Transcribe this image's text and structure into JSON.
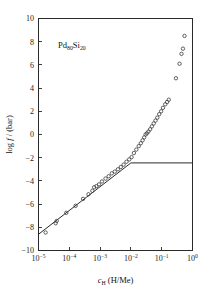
{
  "chart_data": {
    "type": "scatter",
    "title": "",
    "sample_label": {
      "element1": "Pd",
      "subscript1": "80",
      "element2": "Si",
      "subscript2": "20",
      "full": "Pd80Si20"
    },
    "xlabel": {
      "symbol": "c",
      "symbol_sub": "H",
      "units": "(H/Me)",
      "full": "cH (H/Me)"
    },
    "ylabel": {
      "prefix": "log",
      "symbol": "f",
      "suffix": "/ (bar)",
      "full": "log f / (bar)"
    },
    "xscale": "log",
    "xlim": [
      1e-05,
      1
    ],
    "ylim": [
      -10,
      10
    ],
    "grid": false,
    "legend": null,
    "xticks": [
      {
        "value": 1e-05,
        "mantissa": "10",
        "exponent": "−5"
      },
      {
        "value": 0.0001,
        "mantissa": "10",
        "exponent": "−4"
      },
      {
        "value": 0.001,
        "mantissa": "10",
        "exponent": "−3"
      },
      {
        "value": 0.01,
        "mantissa": "10",
        "exponent": "−2"
      },
      {
        "value": 0.1,
        "mantissa": "10",
        "exponent": "−1"
      },
      {
        "value": 1.0,
        "mantissa": "10",
        "exponent": "0"
      }
    ],
    "yticks": [
      {
        "value": 10,
        "label": "10"
      },
      {
        "value": 8,
        "label": "8"
      },
      {
        "value": 6,
        "label": "6"
      },
      {
        "value": 4,
        "label": "4"
      },
      {
        "value": 2,
        "label": "2"
      },
      {
        "value": 0,
        "label": "0"
      },
      {
        "value": -2,
        "label": "−2"
      },
      {
        "value": -4,
        "label": "−4"
      },
      {
        "value": -6,
        "label": "−6"
      },
      {
        "value": -8,
        "label": "−8"
      },
      {
        "value": -10,
        "label": "−10"
      }
    ],
    "series": [
      {
        "name": "measured isotherm",
        "marker": "open-circle",
        "points": [
          {
            "x": 1.7e-05,
            "y": -8.45
          },
          {
            "x": 3.6e-05,
            "y": -7.65
          },
          {
            "x": 3.9e-05,
            "y": -7.45
          },
          {
            "x": 8e-05,
            "y": -6.75
          },
          {
            "x": 0.00016,
            "y": -6.15
          },
          {
            "x": 0.00028,
            "y": -5.55
          },
          {
            "x": 0.00042,
            "y": -5.15
          },
          {
            "x": 0.00056,
            "y": -4.85
          },
          {
            "x": 0.00064,
            "y": -4.55
          },
          {
            "x": 0.00076,
            "y": -4.45
          },
          {
            "x": 0.00092,
            "y": -4.3
          },
          {
            "x": 0.00115,
            "y": -4.05
          },
          {
            "x": 0.0015,
            "y": -3.8
          },
          {
            "x": 0.0019,
            "y": -3.6
          },
          {
            "x": 0.0024,
            "y": -3.35
          },
          {
            "x": 0.003,
            "y": -3.2
          },
          {
            "x": 0.0038,
            "y": -3.0
          },
          {
            "x": 0.0047,
            "y": -2.8
          },
          {
            "x": 0.0058,
            "y": -2.6
          },
          {
            "x": 0.0072,
            "y": -2.35
          },
          {
            "x": 0.0088,
            "y": -2.15
          },
          {
            "x": 0.0105,
            "y": -1.95
          },
          {
            "x": 0.0125,
            "y": -1.6
          },
          {
            "x": 0.015,
            "y": -1.3
          },
          {
            "x": 0.018,
            "y": -1.0
          },
          {
            "x": 0.021,
            "y": -0.75
          },
          {
            "x": 0.024,
            "y": -0.5
          },
          {
            "x": 0.027,
            "y": -0.25
          },
          {
            "x": 0.03,
            "y": 0.0
          },
          {
            "x": 0.033,
            "y": 0.1
          },
          {
            "x": 0.037,
            "y": 0.25
          },
          {
            "x": 0.042,
            "y": 0.45
          },
          {
            "x": 0.048,
            "y": 0.7
          },
          {
            "x": 0.055,
            "y": 0.95
          },
          {
            "x": 0.063,
            "y": 1.2
          },
          {
            "x": 0.072,
            "y": 1.45
          },
          {
            "x": 0.083,
            "y": 1.75
          },
          {
            "x": 0.096,
            "y": 2.0
          },
          {
            "x": 0.11,
            "y": 2.3
          },
          {
            "x": 0.13,
            "y": 2.6
          },
          {
            "x": 0.15,
            "y": 2.8
          },
          {
            "x": 0.17,
            "y": 3.0
          },
          {
            "x": 0.29,
            "y": 4.85
          },
          {
            "x": 0.38,
            "y": 6.1
          },
          {
            "x": 0.44,
            "y": 6.95
          },
          {
            "x": 0.49,
            "y": 7.4
          },
          {
            "x": 0.55,
            "y": 8.5
          }
        ]
      }
    ],
    "annotations": [
      {
        "name": "sieverts-law-line",
        "type": "line",
        "description": "straight fitted Sieverts law line",
        "x_start": 1e-05,
        "y_start": -8.6,
        "x_end": 0.01,
        "y_end": -2.45
      },
      {
        "name": "plateau-line",
        "type": "line",
        "description": "horizontal plateau line",
        "x_start": 0.01,
        "y_start": -2.45,
        "x_end": 1.0,
        "y_end": -2.45
      }
    ]
  }
}
